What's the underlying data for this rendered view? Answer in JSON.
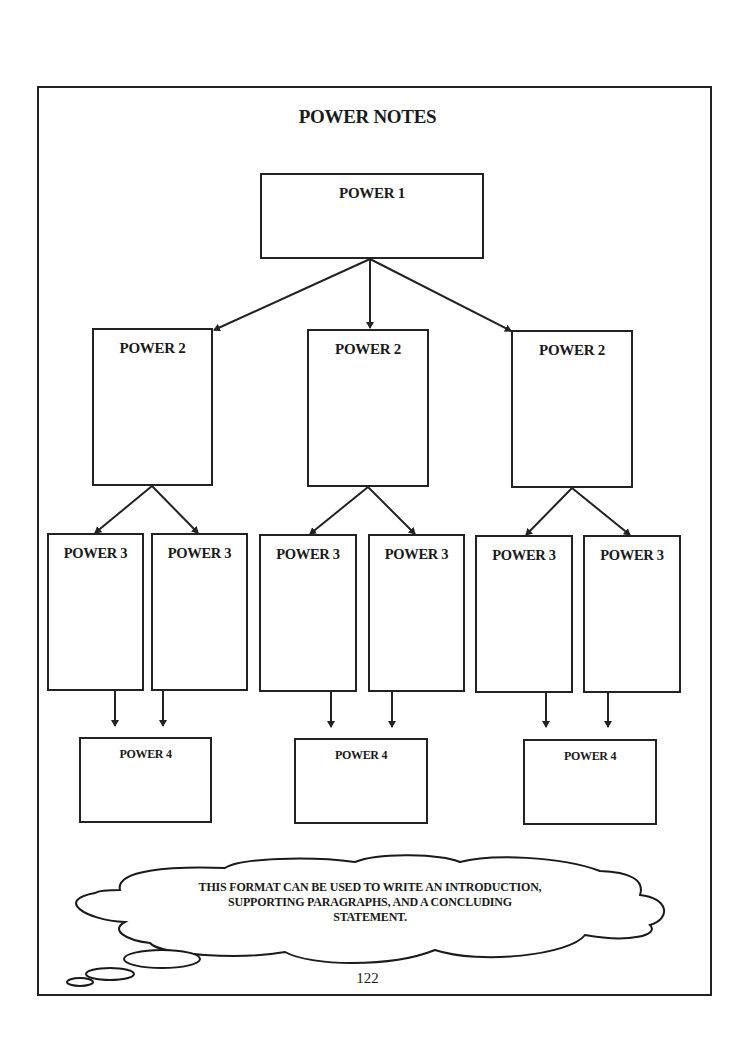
{
  "title": "POWER NOTES",
  "level1": {
    "label": "POWER 1"
  },
  "level2": [
    {
      "label": "POWER 2"
    },
    {
      "label": "POWER 2"
    },
    {
      "label": "POWER 2"
    }
  ],
  "level3": [
    {
      "label": "POWER 3"
    },
    {
      "label": "POWER 3"
    },
    {
      "label": "POWER 3"
    },
    {
      "label": "POWER 3"
    },
    {
      "label": "POWER 3"
    },
    {
      "label": "POWER 3"
    }
  ],
  "level4": [
    {
      "label": "POWER 4"
    },
    {
      "label": "POWER 4"
    },
    {
      "label": "POWER 4"
    }
  ],
  "cloud": {
    "lines": [
      "THIS FORMAT CAN BE USED TO WRITE AN INTRODUCTION,",
      "SUPPORTING PARAGRAPHS, AND A CONCLUDING",
      "STATEMENT."
    ]
  },
  "page_number": "122"
}
